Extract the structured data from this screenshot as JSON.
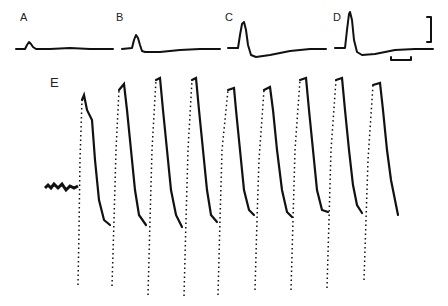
{
  "figure": {
    "panels": [
      {
        "label": "A",
        "description": "small transient deflection"
      },
      {
        "label": "B",
        "description": "larger transient with undershoot"
      },
      {
        "label": "C",
        "description": "spike with pronounced undershoot"
      },
      {
        "label": "D",
        "description": "largest spike with undershoot"
      },
      {
        "label": "E",
        "description": "repetitive oscillation train, 8 peaks"
      }
    ],
    "scale_bars": {
      "vertical": "",
      "horizontal": ""
    }
  }
}
